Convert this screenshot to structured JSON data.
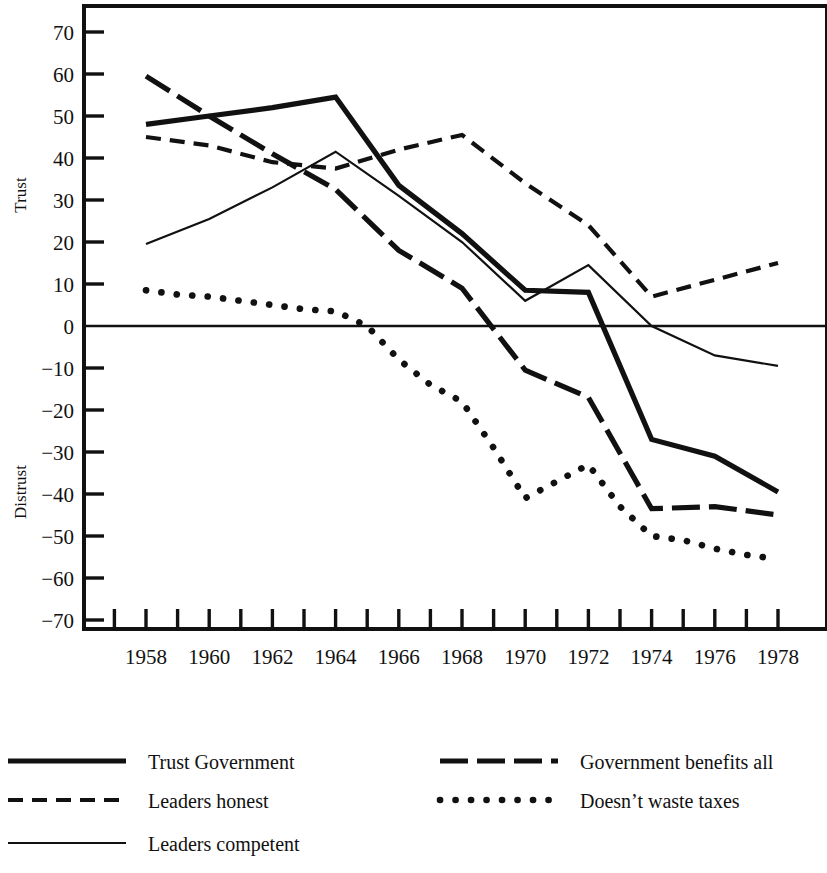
{
  "chart_data": {
    "type": "line",
    "title": "",
    "xlabel": "",
    "ylabel_top": "Trust",
    "ylabel_bottom": "Distrust",
    "xlim": [
      1957,
      1979
    ],
    "ylim": [
      -70,
      75
    ],
    "grid": false,
    "legend_position": "below-chart-two-columns",
    "x_ticks": [
      1957,
      1958,
      1959,
      1960,
      1961,
      1962,
      1963,
      1964,
      1965,
      1966,
      1967,
      1968,
      1969,
      1970,
      1971,
      1972,
      1973,
      1974,
      1975,
      1976,
      1977,
      1978
    ],
    "x_tick_labels": [
      "",
      "1958",
      "",
      "1960",
      "",
      "1962",
      "",
      "1964",
      "",
      "1966",
      "",
      "1968",
      "",
      "1970",
      "",
      "1972",
      "",
      "1974",
      "",
      "1976",
      "",
      "1978"
    ],
    "y_ticks": [
      70,
      60,
      50,
      40,
      30,
      20,
      10,
      0,
      -10,
      -20,
      -30,
      -40,
      -50,
      -60,
      -70
    ],
    "y_tick_labels": [
      "70",
      "60",
      "50",
      "40",
      "30",
      "20",
      "10",
      "0",
      "−10",
      "−20",
      "−30",
      "−40",
      "−50",
      "−60",
      "−70"
    ],
    "zero_line": 0,
    "series": [
      {
        "name": "Trust Government",
        "style": "solid-thick",
        "x": [
          1958,
          1960,
          1962,
          1964,
          1966,
          1968,
          1970,
          1972,
          1974,
          1976,
          1978
        ],
        "values": [
          48,
          50,
          52,
          54.5,
          33.5,
          22,
          8.5,
          8,
          -27,
          -31,
          -39.5
        ]
      },
      {
        "name": "Leaders honest",
        "style": "dashed",
        "x": [
          1958,
          1960,
          1962,
          1964,
          1966,
          1968,
          1970,
          1972,
          1974,
          1976,
          1978
        ],
        "values": [
          45,
          43,
          39,
          37.5,
          42,
          45.5,
          34,
          24,
          7,
          11,
          15
        ]
      },
      {
        "name": "Leaders competent",
        "style": "solid-thin",
        "x": [
          1958,
          1960,
          1962,
          1964,
          1966,
          1968,
          1970,
          1972,
          1974,
          1976,
          1978
        ],
        "values": [
          19.5,
          25.5,
          33,
          41.5,
          31,
          20,
          6,
          14.5,
          0,
          -7,
          -9.5
        ]
      },
      {
        "name": "Government benefits all",
        "style": "long-dash",
        "x": [
          1958,
          1960,
          1962,
          1964,
          1966,
          1968,
          1970,
          1972,
          1974,
          1976,
          1978
        ],
        "values": [
          59.5,
          50,
          41,
          32.5,
          18,
          9,
          -10.5,
          -17,
          -43.5,
          -43,
          -45
        ]
      },
      {
        "name": "Doesn’t waste taxes",
        "style": "dotted",
        "x": [
          1958,
          1959,
          1960,
          1961,
          1962,
          1963,
          1964,
          1965,
          1966,
          1967,
          1968,
          1969,
          1970,
          1971,
          1972,
          1973,
          1974,
          1975,
          1976,
          1977,
          1978
        ],
        "values": [
          8.5,
          7.5,
          7,
          6,
          5,
          4,
          3.5,
          0,
          -8,
          -14,
          -18,
          -29,
          -41,
          -37,
          -33,
          -43,
          -50,
          -51,
          -53,
          -54.5,
          -55.5
        ]
      }
    ]
  },
  "axis": {
    "ylabel_top": "Trust",
    "ylabel_bottom": "Distrust"
  },
  "legend": {
    "column_left": [
      {
        "label": "Trust Government",
        "style": "solid-thick"
      },
      {
        "label": "Leaders honest",
        "style": "dashed"
      },
      {
        "label": "Leaders competent",
        "style": "solid-thin"
      }
    ],
    "column_right": [
      {
        "label": "Government benefits all",
        "style": "long-dash"
      },
      {
        "label": "Doesn’t waste taxes",
        "style": "dotted"
      }
    ]
  }
}
